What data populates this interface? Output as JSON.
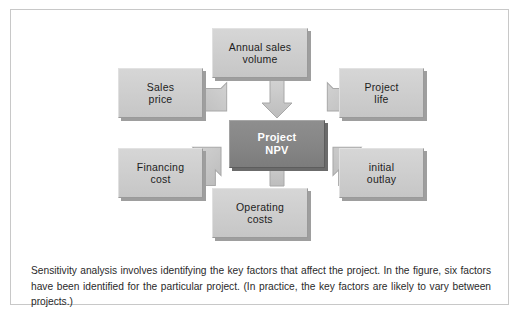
{
  "figure": {
    "center": {
      "id": "project-npv",
      "label": "Project\nNPV",
      "fill": "#868686",
      "text_color": "#ffffff"
    },
    "factors": [
      {
        "id": "annual-sales-volume",
        "label": "Annual sales\nvolume",
        "position": "top"
      },
      {
        "id": "sales-price",
        "label": "Sales\nprice",
        "position": "left-top"
      },
      {
        "id": "project-life",
        "label": "Project\nlife",
        "position": "right-top"
      },
      {
        "id": "financing-cost",
        "label": "Financing\ncost",
        "position": "left-bottom"
      },
      {
        "id": "initial-outlay",
        "label": "initial\noutlay",
        "position": "right-bottom"
      },
      {
        "id": "operating-costs",
        "label": "Operating\ncosts",
        "position": "bottom"
      }
    ],
    "arrows": {
      "count": 6,
      "direction": "inward",
      "fill": "#c4c4c4",
      "stroke": "#a0a0a0"
    },
    "colors": {
      "box_fill": "#cfcfcf",
      "box_border": "#9a9a9a",
      "box_shadow": "#9e9e9e",
      "center_fill": "#868686",
      "frame_border": "#c8c8c8",
      "page_background": "#ffffff",
      "caption_text": "#2a2a2a"
    }
  },
  "caption": {
    "text": "Sensitivity analysis involves identifying the key factors that affect the project. In the figure, six factors have been identified for the particular project. (In practice, the key factors are likely to vary between projects.)"
  }
}
